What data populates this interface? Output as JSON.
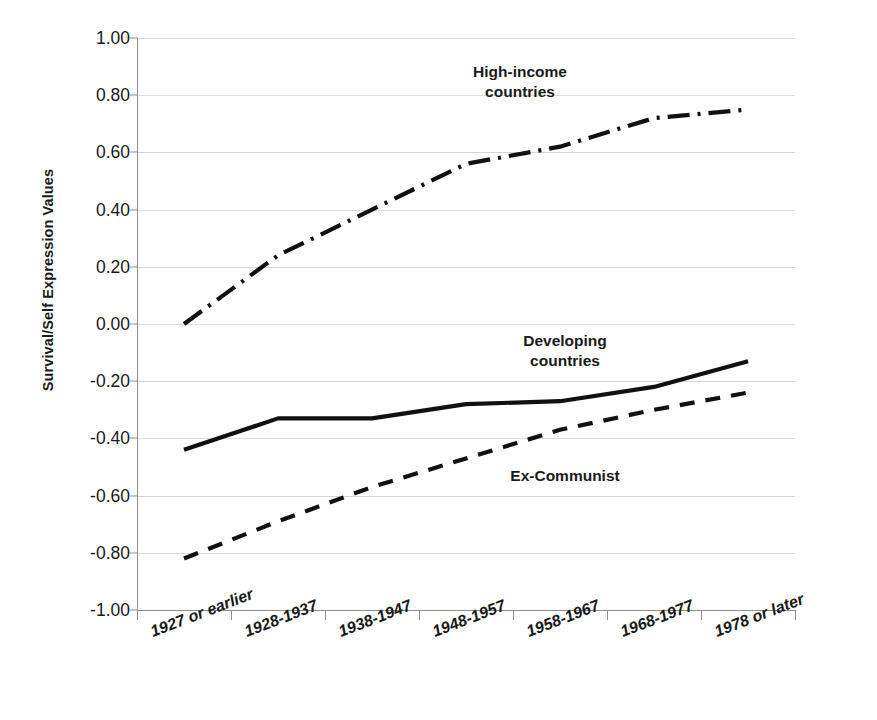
{
  "chart_data": {
    "type": "line",
    "title": "",
    "xlabel": "",
    "ylabel": "Survival/Self Expression Values",
    "ylim": [
      -1.0,
      1.0
    ],
    "ytick_step": 0.2,
    "grid": true,
    "legend_position": "inline-annotations",
    "categories": [
      "1927 or earlier",
      "1928-1937",
      "1938-1947",
      "1948-1957",
      "1958-1967",
      "1968-1977",
      "1978 or later"
    ],
    "ytick_labels": [
      "1.00",
      "0.80",
      "0.60",
      "0.40",
      "0.20",
      "0.00",
      "-0.20",
      "-0.40",
      "-0.60",
      "-0.80",
      "-1.00"
    ],
    "ytick_values": [
      1.0,
      0.8,
      0.6,
      0.4,
      0.2,
      0.0,
      -0.2,
      -0.4,
      -0.6,
      -0.8,
      -1.0
    ],
    "series": [
      {
        "name": "High-income countries",
        "label_line1": "High-income",
        "label_line2": "countries",
        "style": "dash-dot",
        "color": "#111111",
        "values": [
          0.0,
          0.24,
          0.4,
          0.56,
          0.62,
          0.72,
          0.75
        ]
      },
      {
        "name": "Developing countries",
        "label_line1": "Developing",
        "label_line2": "countries",
        "style": "solid",
        "color": "#111111",
        "values": [
          -0.44,
          -0.33,
          -0.33,
          -0.28,
          -0.27,
          -0.22,
          -0.13
        ]
      },
      {
        "name": "Ex-Communist",
        "label_line1": "Ex-Communist",
        "label_line2": "",
        "style": "dashed",
        "color": "#111111",
        "values": [
          -0.82,
          -0.69,
          -0.57,
          -0.47,
          -0.37,
          -0.3,
          -0.24
        ]
      }
    ]
  },
  "axis": {
    "y_title": "Survival/Self Expression Values"
  },
  "colors": {
    "gridline": "#d4d4d4",
    "axis": "#8d8d8d",
    "series": "#111111",
    "background": "#ffffff"
  }
}
